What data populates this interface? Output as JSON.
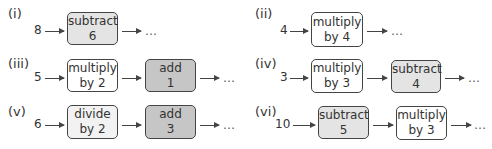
{
  "colors": {
    "subtract_fill": "#e4e4e4",
    "add_fill": "#c6c6c6",
    "multiply_fill": "#ffffff",
    "divide_fill": "#f2f2f2",
    "border": "#444444"
  },
  "ellipsis": "…",
  "machines": [
    {
      "label": "(i)",
      "input": "8",
      "steps": [
        {
          "op": "subtract",
          "operand": "6",
          "fill": "#e4e4e4"
        }
      ]
    },
    {
      "label": "(ii)",
      "input": "4",
      "steps": [
        {
          "op": "multiply",
          "operand": "by 4",
          "fill": "#ffffff"
        }
      ]
    },
    {
      "label": "(iii)",
      "input": "5",
      "steps": [
        {
          "op": "multiply",
          "operand": "by 2",
          "fill": "#ffffff"
        },
        {
          "op": "add",
          "operand": "1",
          "fill": "#c6c6c6"
        }
      ]
    },
    {
      "label": "(iv)",
      "input": "3",
      "steps": [
        {
          "op": "multiply",
          "operand": "by 3",
          "fill": "#ffffff"
        },
        {
          "op": "subtract",
          "operand": "4",
          "fill": "#e4e4e4"
        }
      ]
    },
    {
      "label": "(v)",
      "input": "6",
      "steps": [
        {
          "op": "divide",
          "operand": "by 2",
          "fill": "#f2f2f2"
        },
        {
          "op": "add",
          "operand": "3",
          "fill": "#c6c6c6"
        }
      ]
    },
    {
      "label": "(vi)",
      "input": "10",
      "steps": [
        {
          "op": "subtract",
          "operand": "5",
          "fill": "#e4e4e4"
        },
        {
          "op": "multiply",
          "operand": "by 3",
          "fill": "#ffffff"
        }
      ]
    }
  ]
}
